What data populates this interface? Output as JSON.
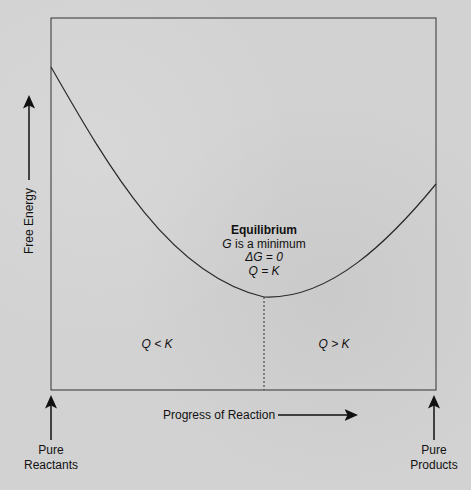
{
  "diagram": {
    "type": "free-energy-vs-reaction-progress",
    "y_axis_label": "Free Energy",
    "x_axis_label": "Progress of Reaction",
    "left_endpoint": [
      "Pure",
      "Reactants"
    ],
    "right_endpoint": [
      "Pure",
      "Products"
    ],
    "equilibrium": {
      "title": "Equilibrium",
      "line1_var": "G",
      "line1_rest": " is a minimum",
      "line2": "ΔG = 0",
      "line3": "Q = K"
    },
    "region_left": "Q < K",
    "region_right": "Q > K",
    "colors": {
      "line": "#2a2a2a",
      "background": "#d2d2d2",
      "text": "#111111"
    }
  }
}
